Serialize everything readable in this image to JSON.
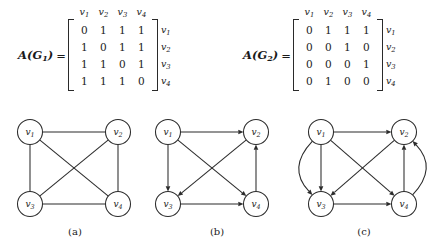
{
  "matrices": [
    {
      "id": "A_G1",
      "label_main": "A",
      "label_open": "(G",
      "label_sub": "1",
      "label_close": ")",
      "equals": "=",
      "col_headers": [
        "v",
        "v",
        "v",
        "v"
      ],
      "col_header_subs": [
        "1",
        "2",
        "3",
        "4"
      ],
      "row_labels": [
        "v",
        "v",
        "v",
        "v"
      ],
      "row_label_subs": [
        "1",
        "2",
        "3",
        "4"
      ],
      "rows": [
        [
          "0",
          "1",
          "1",
          "1"
        ],
        [
          "1",
          "0",
          "1",
          "1"
        ],
        [
          "1",
          "1",
          "0",
          "1"
        ],
        [
          "1",
          "1",
          "1",
          "0"
        ]
      ]
    },
    {
      "id": "A_G2",
      "label_main": "A",
      "label_open": "(G",
      "label_sub": "2",
      "label_close": ")",
      "equals": "=",
      "col_headers": [
        "v",
        "v",
        "v",
        "v"
      ],
      "col_header_subs": [
        "1",
        "2",
        "3",
        "4"
      ],
      "row_labels": [
        "v",
        "v",
        "v",
        "v"
      ],
      "row_label_subs": [
        "1",
        "2",
        "3",
        "4"
      ],
      "rows": [
        [
          "0",
          "1",
          "1",
          "1"
        ],
        [
          "0",
          "0",
          "1",
          "0"
        ],
        [
          "0",
          "0",
          "0",
          "1"
        ],
        [
          "0",
          "1",
          "0",
          "0"
        ]
      ]
    }
  ],
  "graphs": [
    {
      "id": "graph-a",
      "caption": "(a)",
      "directed": false,
      "nodes": [
        {
          "id": "v1",
          "label": "v",
          "sub": "1",
          "x": 30,
          "y": 28
        },
        {
          "id": "v2",
          "label": "v",
          "sub": "2",
          "x": 118,
          "y": 28
        },
        {
          "id": "v3",
          "label": "v",
          "sub": "3",
          "x": 30,
          "y": 100
        },
        {
          "id": "v4",
          "label": "v",
          "sub": "4",
          "x": 118,
          "y": 100
        }
      ],
      "edges": [
        {
          "from": "v1",
          "to": "v2"
        },
        {
          "from": "v1",
          "to": "v3"
        },
        {
          "from": "v1",
          "to": "v4"
        },
        {
          "from": "v2",
          "to": "v3"
        },
        {
          "from": "v2",
          "to": "v4"
        },
        {
          "from": "v3",
          "to": "v4"
        }
      ]
    },
    {
      "id": "graph-b",
      "caption": "(b)",
      "directed": true,
      "nodes": [
        {
          "id": "v1",
          "label": "v",
          "sub": "1",
          "x": 26,
          "y": 28
        },
        {
          "id": "v2",
          "label": "v",
          "sub": "2",
          "x": 114,
          "y": 28
        },
        {
          "id": "v3",
          "label": "v",
          "sub": "3",
          "x": 26,
          "y": 100
        },
        {
          "id": "v4",
          "label": "v",
          "sub": "4",
          "x": 114,
          "y": 100
        }
      ],
      "edges": [
        {
          "from": "v1",
          "to": "v2"
        },
        {
          "from": "v1",
          "to": "v3"
        },
        {
          "from": "v1",
          "to": "v4"
        },
        {
          "from": "v2",
          "to": "v3"
        },
        {
          "from": "v3",
          "to": "v4"
        },
        {
          "from": "v4",
          "to": "v2"
        }
      ]
    },
    {
      "id": "graph-c",
      "caption": "(c)",
      "directed": true,
      "nodes": [
        {
          "id": "v1",
          "label": "v",
          "sub": "1",
          "x": 37,
          "y": 28
        },
        {
          "id": "v2",
          "label": "v",
          "sub": "2",
          "x": 120,
          "y": 28
        },
        {
          "id": "v3",
          "label": "v",
          "sub": "3",
          "x": 37,
          "y": 100
        },
        {
          "id": "v4",
          "label": "v",
          "sub": "4",
          "x": 120,
          "y": 100
        }
      ],
      "edges": [
        {
          "from": "v1",
          "to": "v2"
        },
        {
          "from": "v1",
          "to": "v3"
        },
        {
          "from": "v1",
          "to": "v4"
        },
        {
          "from": "v2",
          "to": "v3"
        },
        {
          "from": "v3",
          "to": "v4"
        },
        {
          "from": "v4",
          "to": "v2"
        },
        {
          "from": "v1",
          "to": "v3",
          "curve": "left"
        },
        {
          "from": "v4",
          "to": "v2",
          "curve": "right"
        }
      ]
    }
  ],
  "colors": {
    "stroke": "#2b2b2b",
    "background": "#ffffff",
    "text": "#1a1a1a"
  }
}
